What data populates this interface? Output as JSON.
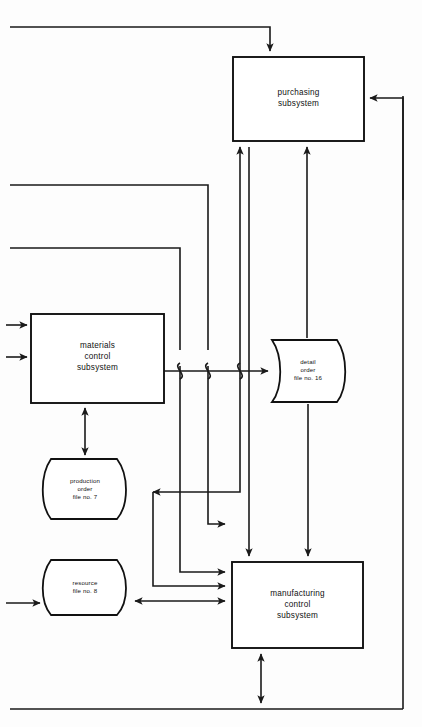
{
  "diagram": {
    "background_color": "#fdfdfd",
    "line_color": "#1a1a1a",
    "box_fill": "#ffffff",
    "nodes": {
      "purchasing": {
        "id": "purchasing-subsystem",
        "shape": "rectangle",
        "line1": "purchasing",
        "line2": "subsystem",
        "x": 233,
        "y": 57,
        "width": 131,
        "height": 84
      },
      "materials": {
        "id": "materials-control-subsystem",
        "shape": "rectangle",
        "line1": "materials",
        "line2": "control",
        "line3": "subsystem",
        "x": 31,
        "y": 314,
        "width": 133,
        "height": 89
      },
      "manufacturing": {
        "id": "manufacturing-control-subsystem",
        "shape": "rectangle",
        "line1": "manufacturing",
        "line2": "control",
        "line3": "subsystem",
        "x": 232,
        "y": 562,
        "width": 131,
        "height": 86
      },
      "detail_order": {
        "id": "detail-order-file",
        "shape": "drum",
        "line1": "detail",
        "line2": "order",
        "line3": "file no. 16",
        "x": 272,
        "y": 340,
        "width": 81,
        "height": 62
      },
      "production_order": {
        "id": "production-order-file",
        "shape": "drum",
        "line1": "production",
        "line2": "order",
        "line3": "file no. 7",
        "x": 40,
        "y": 459,
        "width": 92,
        "height": 60
      },
      "resource": {
        "id": "resource-file",
        "shape": "drum",
        "line1": "resource",
        "line2": "file no. 8",
        "x": 40,
        "y": 560,
        "width": 92,
        "height": 55
      }
    }
  }
}
